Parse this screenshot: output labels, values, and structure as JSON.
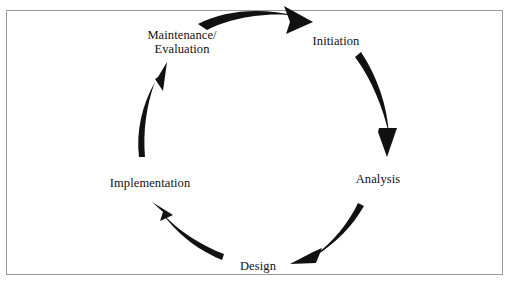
{
  "figure": {
    "border_color": "#9b9b9b",
    "background_color": "#ffffff",
    "arrow_color": "#111111",
    "text_color": "#111111",
    "direction": "clockwise"
  },
  "phases": [
    {
      "id": "maintenance",
      "label": "Maintenance/\nEvaluation",
      "position": "top-left"
    },
    {
      "id": "initiation",
      "label": "Initiation",
      "position": "top-right"
    },
    {
      "id": "analysis",
      "label": "Analysis",
      "position": "right"
    },
    {
      "id": "design",
      "label": "Design",
      "position": "bottom"
    },
    {
      "id": "implementation",
      "label": "Implementation",
      "position": "left"
    }
  ],
  "arrows": [
    {
      "id": "maintenance-to-initiation",
      "from": "maintenance",
      "to": "initiation",
      "head": "down-right"
    },
    {
      "id": "initiation-to-analysis",
      "from": "initiation",
      "to": "analysis",
      "head": "down"
    },
    {
      "id": "analysis-to-design",
      "from": "analysis",
      "to": "design",
      "head": "left"
    },
    {
      "id": "design-to-implementation",
      "from": "design",
      "to": "implementation",
      "head": "up-left"
    },
    {
      "id": "implementation-to-maintenance",
      "from": "implementation",
      "to": "maintenance",
      "head": "up-right"
    }
  ]
}
